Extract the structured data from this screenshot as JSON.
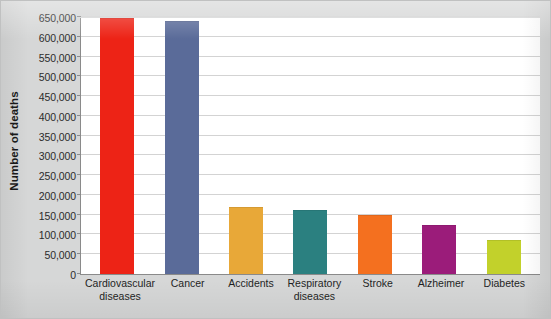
{
  "figure": {
    "background_color": "#d6d7d7",
    "plot_background_color": "#ffffff",
    "axis_color": "#8a8a8a",
    "gridline_color": "#d3d3d3"
  },
  "chart_data": {
    "type": "bar",
    "title": "",
    "xlabel": "",
    "ylabel": "Number of deaths",
    "categories": [
      "Cardiovascular diseases",
      "Cancer",
      "Accidents",
      "Respiratory diseases",
      "Stroke",
      "Alzheimer",
      "Diabetes"
    ],
    "values": [
      645000,
      637000,
      167000,
      160000,
      146000,
      122000,
      84000
    ],
    "colors": [
      "#ed2316",
      "#5a6b99",
      "#e8a838",
      "#2b8080",
      "#f4701f",
      "#9b1c7a",
      "#c2d12b"
    ],
    "ylim": [
      0,
      650000
    ],
    "ytick_step": 50000,
    "yticks": [
      0,
      50000,
      100000,
      150000,
      200000,
      250000,
      300000,
      350000,
      400000,
      450000,
      500000,
      550000,
      600000,
      650000
    ],
    "ytick_labels": [
      "0",
      "50,000",
      "100,000",
      "150,000",
      "200,000",
      "250,000",
      "300,000",
      "350,000",
      "400,000",
      "450,000",
      "500,000",
      "550,000",
      "600,000",
      "650,000"
    ],
    "grid": true,
    "legend": false,
    "legend_position": "none"
  }
}
